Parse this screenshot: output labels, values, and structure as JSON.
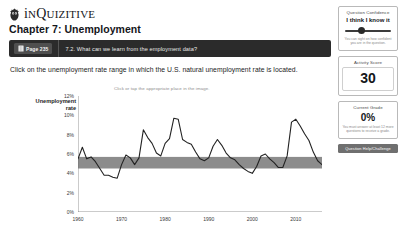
{
  "brand": {
    "name_prefix": "i",
    "name_small": "N",
    "name_rest": "Q",
    "full": "inQuizitive",
    "logo_icon": "owl-logo-icon"
  },
  "header": {
    "chapter_title": "Chapter 7: Unemployment"
  },
  "question_bar": {
    "page_badge_label": "Page 235",
    "book_icon": "book-icon",
    "question_text": "7.2. What can we learn from the employment data?"
  },
  "prompt": "Click on the unemployment rate range in which the U.S. natural unemployment rate is located.",
  "chart_hint": "Click or tap the appropriate place in the image.",
  "rail": {
    "confidence": {
      "title": "Question Confidence",
      "value_label": "I think I know it",
      "note": "You can sight on how confident you are in the question.",
      "slider_name": "confidence-slider"
    },
    "activity": {
      "title": "Activity Score",
      "value": "30"
    },
    "grade": {
      "title": "Current Grade",
      "value": "0%",
      "note": "You must answer at least 12 more questions to receive a grade."
    },
    "help_button": "Question Help/Challenge"
  },
  "chart_data": {
    "type": "line",
    "title": "",
    "xlabel": "",
    "ylabel": "Unemployment rate",
    "xlim": [
      1960,
      2016
    ],
    "ylim": [
      0,
      12
    ],
    "ytick_labels": [
      "12%",
      "10%",
      "8%",
      "6%",
      "4%",
      "2%",
      "0%"
    ],
    "ytick_values": [
      12,
      10,
      8,
      6,
      4,
      2,
      0
    ],
    "xtick_labels": [
      "1960",
      "1970",
      "1980",
      "1990",
      "2000",
      "2010"
    ],
    "xtick_values": [
      1960,
      1970,
      1980,
      1990,
      2000,
      2010
    ],
    "grid": false,
    "legend": "none",
    "highlight_band": {
      "y_from": 4.5,
      "y_to": 5.7,
      "color": "#8c8c8c",
      "label": "selected-range-band"
    },
    "series": [
      {
        "name": "U.S. unemployment rate",
        "color": "#222222",
        "x": [
          1960,
          1961,
          1962,
          1963,
          1964,
          1965,
          1966,
          1967,
          1968,
          1969,
          1970,
          1971,
          1972,
          1973,
          1974,
          1975,
          1976,
          1977,
          1978,
          1979,
          1980,
          1981,
          1982,
          1983,
          1984,
          1985,
          1986,
          1987,
          1988,
          1989,
          1990,
          1991,
          1992,
          1993,
          1994,
          1995,
          1996,
          1997,
          1998,
          1999,
          2000,
          2001,
          2002,
          2003,
          2004,
          2005,
          2006,
          2007,
          2008,
          2009,
          2010,
          2011,
          2012,
          2013,
          2014,
          2015,
          2016
        ],
        "values": [
          5.5,
          6.7,
          5.5,
          5.7,
          5.2,
          4.5,
          3.8,
          3.8,
          3.6,
          3.5,
          4.9,
          5.9,
          5.6,
          4.9,
          5.6,
          8.5,
          7.7,
          7.1,
          6.1,
          5.8,
          7.1,
          7.6,
          9.7,
          9.6,
          7.5,
          7.2,
          7.0,
          6.2,
          5.5,
          5.3,
          5.6,
          6.8,
          7.5,
          6.9,
          6.1,
          5.6,
          5.4,
          4.9,
          4.5,
          4.2,
          4.0,
          4.7,
          5.8,
          6.0,
          5.5,
          5.1,
          4.6,
          4.6,
          5.8,
          9.3,
          9.6,
          8.9,
          8.1,
          7.4,
          6.2,
          5.3,
          4.9
        ]
      }
    ]
  }
}
